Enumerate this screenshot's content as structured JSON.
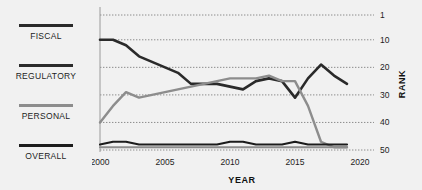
{
  "legend": {
    "items": [
      {
        "label": "FISCAL",
        "color": "#2a2a2a"
      },
      {
        "label": "REGULATORY",
        "color": "#2b2b2b"
      },
      {
        "label": "PERSONAL",
        "color": "#8d8d8d"
      },
      {
        "label": "OVERALL",
        "color": "#1c1c1c"
      }
    ]
  },
  "chart_data": {
    "type": "line",
    "title": "",
    "xlabel": "YEAR",
    "ylabel": "RANK",
    "xlim": [
      2000,
      2020
    ],
    "ylim": [
      1,
      50
    ],
    "y_inverted": true,
    "grid": true,
    "legend_position": "left",
    "x_ticks": [
      "2000",
      "2005",
      "2010",
      "2015",
      "2020"
    ],
    "y_ticks": [
      "1",
      "10",
      "20",
      "30",
      "40",
      "50"
    ],
    "x_tick_values": [
      2000,
      2005,
      2010,
      2015,
      2020
    ],
    "y_tick_values": [
      1,
      10,
      20,
      30,
      40,
      50
    ],
    "x": [
      2000,
      2001,
      2002,
      2003,
      2004,
      2005,
      2006,
      2007,
      2008,
      2009,
      2010,
      2011,
      2012,
      2013,
      2014,
      2015,
      2016,
      2017,
      2018,
      2019
    ],
    "series": [
      {
        "name": "FISCAL",
        "color": "#2a2a2a",
        "width": 2.6,
        "values": [
          10,
          10,
          12,
          16,
          18,
          20,
          22,
          26,
          26,
          26,
          27,
          28,
          25,
          24,
          25,
          31,
          24,
          19,
          23,
          26
        ]
      },
      {
        "name": "REGULATORY",
        "color": "#8d8d8d",
        "width": 2.4,
        "values": [
          40,
          34,
          29,
          31,
          30,
          29,
          28,
          27,
          26,
          25,
          24,
          24,
          24,
          23,
          25,
          25,
          34,
          47,
          49,
          49
        ]
      },
      {
        "name": "PERSONAL",
        "color": "#8d8d8d",
        "width": 2.0,
        "values": [
          49,
          49,
          49,
          49,
          49,
          49,
          49,
          49,
          49,
          49,
          49,
          49,
          49,
          49,
          49,
          49,
          49,
          49,
          49,
          49
        ]
      },
      {
        "name": "OVERALL",
        "color": "#1c1c1c",
        "width": 2.2,
        "values": [
          48,
          47,
          47,
          48,
          48,
          48,
          48,
          48,
          48,
          48,
          47,
          47,
          48,
          48,
          48,
          47,
          48,
          48,
          48,
          48
        ]
      }
    ]
  }
}
